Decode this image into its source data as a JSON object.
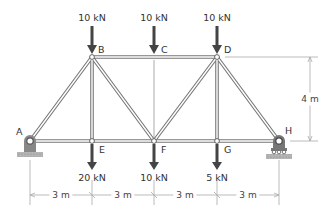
{
  "colors": {
    "member": "#777777",
    "member_fill": "#ffffff",
    "arrow": "#444444",
    "support": "#888888",
    "ground": "#aaaaaa",
    "dimension": "#999999",
    "text": "#333333"
  },
  "nodes": [
    {
      "id": "A",
      "x_m": 0,
      "y_m": 0
    },
    {
      "id": "B",
      "x_m": 3,
      "y_m": 4
    },
    {
      "id": "C",
      "x_m": 6,
      "y_m": 4
    },
    {
      "id": "D",
      "x_m": 9,
      "y_m": 4
    },
    {
      "id": "E",
      "x_m": 3,
      "y_m": 0
    },
    {
      "id": "F",
      "x_m": 6,
      "y_m": 0
    },
    {
      "id": "G",
      "x_m": 9,
      "y_m": 0
    },
    {
      "id": "H",
      "x_m": 12,
      "y_m": 0
    }
  ],
  "node_labels": {
    "A": "A",
    "B": "B",
    "C": "C",
    "D": "D",
    "E": "E",
    "F": "F",
    "G": "G",
    "H": "H"
  },
  "members": [
    [
      "A",
      "B"
    ],
    [
      "A",
      "E"
    ],
    [
      "B",
      "E"
    ],
    [
      "B",
      "F"
    ],
    [
      "B",
      "C"
    ],
    [
      "C",
      "D"
    ],
    [
      "E",
      "F"
    ],
    [
      "F",
      "D"
    ],
    [
      "F",
      "G"
    ],
    [
      "D",
      "G"
    ],
    [
      "D",
      "H"
    ],
    [
      "G",
      "H"
    ]
  ],
  "zero_force_hint": {
    "from": "C",
    "to": "F",
    "style": "thin line"
  },
  "supports": [
    {
      "node": "A",
      "type": "pin"
    },
    {
      "node": "H",
      "type": "roller"
    }
  ],
  "loads": {
    "top": [
      {
        "node": "B",
        "label": "10 kN",
        "direction": "down"
      },
      {
        "node": "C",
        "label": "10 kN",
        "direction": "down"
      },
      {
        "node": "D",
        "label": "10 kN",
        "direction": "down"
      }
    ],
    "bottom": [
      {
        "node": "E",
        "label": "20 kN",
        "direction": "down"
      },
      {
        "node": "F",
        "label": "10 kN",
        "direction": "down"
      },
      {
        "node": "G",
        "label": "5 kN",
        "direction": "down"
      }
    ]
  },
  "dimensions": {
    "horizontal": [
      "3 m",
      "3 m",
      "3 m",
      "3 m"
    ],
    "vertical": "4 m"
  }
}
